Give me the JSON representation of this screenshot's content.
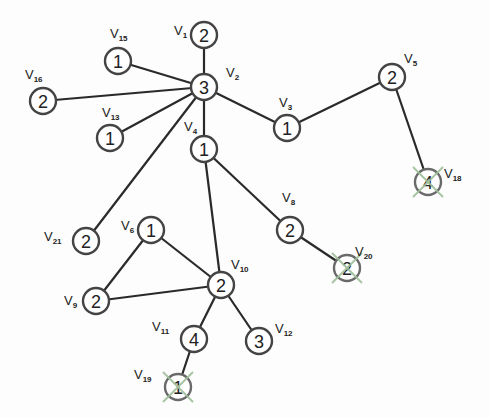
{
  "diagram": {
    "type": "graph",
    "nodes": [
      {
        "id": "v1",
        "label": "V",
        "sub": "1",
        "value": "2",
        "x": 204,
        "y": 35,
        "lx": -30,
        "ly": 0,
        "crossed": false
      },
      {
        "id": "v2",
        "label": "V",
        "sub": "2",
        "value": "3",
        "x": 204,
        "y": 87,
        "lx": 22,
        "ly": -10,
        "crossed": false
      },
      {
        "id": "v15",
        "label": "V",
        "sub": "15",
        "value": "1",
        "x": 118,
        "y": 61,
        "lx": -8,
        "ly": -23,
        "crossed": false
      },
      {
        "id": "v16",
        "label": "V",
        "sub": "16",
        "value": "2",
        "x": 43,
        "y": 101,
        "lx": -18,
        "ly": -22,
        "crossed": false
      },
      {
        "id": "v13",
        "label": "V",
        "sub": "13",
        "value": "1",
        "x": 110,
        "y": 138,
        "lx": -8,
        "ly": -21,
        "crossed": false
      },
      {
        "id": "v3",
        "label": "V",
        "sub": "3",
        "value": "1",
        "x": 287,
        "y": 128,
        "lx": -8,
        "ly": -21,
        "crossed": false
      },
      {
        "id": "v5",
        "label": "V",
        "sub": "5",
        "value": "2",
        "x": 392,
        "y": 77,
        "lx": 12,
        "ly": -14,
        "crossed": false
      },
      {
        "id": "v18",
        "label": "V",
        "sub": "18",
        "value": "4",
        "x": 428,
        "y": 182,
        "lx": 16,
        "ly": -4,
        "crossed": true
      },
      {
        "id": "v4",
        "label": "V",
        "sub": "4",
        "value": "1",
        "x": 204,
        "y": 149,
        "lx": -20,
        "ly": -18,
        "crossed": false
      },
      {
        "id": "v8",
        "label": "V",
        "sub": "8",
        "value": "2",
        "x": 290,
        "y": 230,
        "lx": -8,
        "ly": -28,
        "crossed": false
      },
      {
        "id": "v20",
        "label": "V",
        "sub": "20",
        "value": "2",
        "x": 347,
        "y": 268,
        "lx": 8,
        "ly": -12,
        "crossed": true
      },
      {
        "id": "v21",
        "label": "V",
        "sub": "21",
        "value": "2",
        "x": 86,
        "y": 241,
        "lx": -42,
        "ly": 0,
        "crossed": false
      },
      {
        "id": "v6",
        "label": "V",
        "sub": "6",
        "value": "1",
        "x": 151,
        "y": 230,
        "lx": -30,
        "ly": 0,
        "crossed": false
      },
      {
        "id": "v9",
        "label": "V",
        "sub": "9",
        "value": "2",
        "x": 96,
        "y": 301,
        "lx": -32,
        "ly": 4,
        "crossed": false
      },
      {
        "id": "v10",
        "label": "V",
        "sub": "10",
        "value": "2",
        "x": 221,
        "y": 285,
        "lx": 10,
        "ly": -16,
        "crossed": false
      },
      {
        "id": "v11",
        "label": "V",
        "sub": "11",
        "value": "4",
        "x": 194,
        "y": 339,
        "lx": -42,
        "ly": -8,
        "crossed": false
      },
      {
        "id": "v12",
        "label": "V",
        "sub": "12",
        "value": "3",
        "x": 259,
        "y": 341,
        "lx": 16,
        "ly": -8,
        "crossed": false
      },
      {
        "id": "v19",
        "label": "V",
        "sub": "19",
        "value": "1",
        "x": 178,
        "y": 387,
        "lx": -44,
        "ly": -8,
        "crossed": true
      }
    ],
    "edges": [
      [
        "v1",
        "v2"
      ],
      [
        "v2",
        "v15"
      ],
      [
        "v2",
        "v16"
      ],
      [
        "v2",
        "v13"
      ],
      [
        "v2",
        "v3"
      ],
      [
        "v3",
        "v5"
      ],
      [
        "v5",
        "v18"
      ],
      [
        "v2",
        "v4"
      ],
      [
        "v2",
        "v21"
      ],
      [
        "v4",
        "v8"
      ],
      [
        "v8",
        "v20"
      ],
      [
        "v4",
        "v10"
      ],
      [
        "v6",
        "v10"
      ],
      [
        "v6",
        "v9"
      ],
      [
        "v9",
        "v10"
      ],
      [
        "v10",
        "v11"
      ],
      [
        "v10",
        "v12"
      ],
      [
        "v11",
        "v19"
      ]
    ],
    "colors": {
      "edge": "#2a2a2a",
      "node_stroke": "#444444",
      "cross": "#9fbf9a"
    }
  }
}
